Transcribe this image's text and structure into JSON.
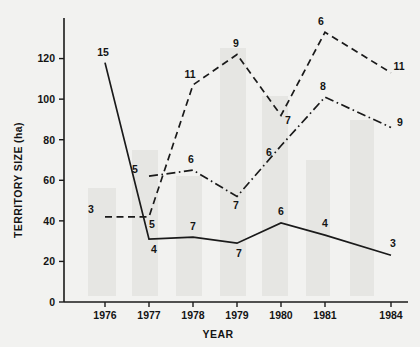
{
  "chart_data": {
    "type": "line",
    "title": "",
    "xlabel": "YEAR",
    "ylabel": "TERRITORY SIZE (ha)",
    "categories": [
      "1976",
      "1977",
      "1978",
      "1979",
      "1980",
      "1981",
      "1984"
    ],
    "x_tick_labels": [
      "1976",
      "1977",
      "1978",
      "1979",
      "1980",
      "1981",
      "1984"
    ],
    "y_tick_labels": [
      "0",
      "20",
      "40",
      "60",
      "80",
      "100",
      "120"
    ],
    "y_ticks": [
      0,
      20,
      40,
      60,
      80,
      100,
      120
    ],
    "ylim": [
      0,
      140
    ],
    "grid": false,
    "legend_position": "none",
    "point_labels_meaning": "sample size (n) printed next to each data point",
    "series": [
      {
        "name": "solid-series",
        "style": "solid",
        "x": [
          "1976",
          "1977",
          "1978",
          "1979",
          "1980",
          "1981",
          "1984"
        ],
        "values": [
          118,
          31,
          32,
          29,
          39,
          33,
          23
        ],
        "point_labels": [
          "15",
          "4",
          "7",
          "7",
          "6",
          "4",
          "3"
        ]
      },
      {
        "name": "dashed-series",
        "style": "dashed",
        "x": [
          "1976",
          "1977",
          "1978",
          "1979",
          "1980",
          "1981",
          "1984"
        ],
        "values": [
          42,
          42,
          107,
          122,
          92,
          133,
          113
        ],
        "point_labels": [
          "3",
          "5",
          "11",
          "9",
          "7",
          "6",
          "11"
        ]
      },
      {
        "name": "dash-dot-series",
        "style": "dash-dot",
        "x": [
          "1977",
          "1978",
          "1979",
          "1980",
          "1981",
          "1984"
        ],
        "values": [
          62,
          65,
          52,
          77,
          101,
          86
        ],
        "point_labels": [
          "5",
          "6",
          "7",
          "6",
          "8",
          "9"
        ]
      }
    ]
  },
  "axes": {
    "y_title": "TERRITORY SIZE (ha)",
    "x_title": "YEAR"
  }
}
